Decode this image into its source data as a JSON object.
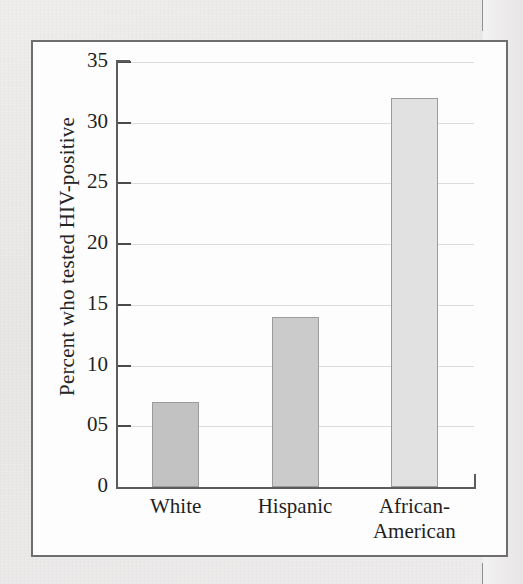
{
  "figure": {
    "border_color": "#6e6e6e",
    "panel_color": "#fdfdfd"
  },
  "chart_data": {
    "type": "bar",
    "title": "",
    "xlabel": "",
    "ylabel": "Percent who tested HIV-positive",
    "categories": [
      "White",
      "Hispanic",
      "African-American"
    ],
    "category_lines": [
      [
        "White"
      ],
      [
        "Hispanic"
      ],
      [
        "African-",
        "American"
      ]
    ],
    "values": [
      7,
      14,
      32
    ],
    "ylim": [
      0,
      35
    ],
    "ytick_values": [
      0,
      5,
      10,
      15,
      20,
      25,
      30,
      35
    ],
    "ytick_labels": [
      "0",
      "05",
      "10",
      "15",
      "20",
      "25",
      "30",
      "35"
    ],
    "grid": true,
    "legend": false,
    "bar_colors": [
      "#c2c2c2",
      "#cbcbcb",
      "#e1e1e1"
    ],
    "bar_edge_color": "#9b9b9b"
  }
}
